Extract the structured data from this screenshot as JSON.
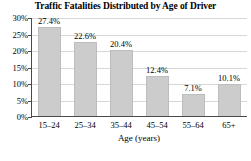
{
  "chart_data": {
    "type": "bar",
    "title": "Traffic Fatalities Distributed by Age of Driver",
    "xlabel": "Age (years)",
    "ylabel": "",
    "categories": [
      "15–24",
      "25–34",
      "35–44",
      "45–54",
      "55–64",
      "65+"
    ],
    "values": [
      27.4,
      22.6,
      20.4,
      12.4,
      7.1,
      10.1
    ],
    "data_labels": [
      "27.4%",
      "22.6%",
      "20.4%",
      "12.4%",
      "7.1%",
      "10.1%"
    ],
    "ylim": [
      0,
      30
    ],
    "ytick_values": [
      0,
      5,
      10,
      15,
      20,
      25,
      30
    ],
    "ytick_labels": [
      "0%",
      "5%",
      "10%",
      "15%",
      "20%",
      "25%",
      "30%"
    ],
    "grid": "horizontal",
    "legend": "none",
    "bar_color": "#cccccc",
    "bar_edge_color": "#bdbdbd",
    "gridline_color": "#d7d7d7",
    "axis_color": "#4a4a4a",
    "background_color": "#ffffff",
    "text_color": "#000000"
  }
}
